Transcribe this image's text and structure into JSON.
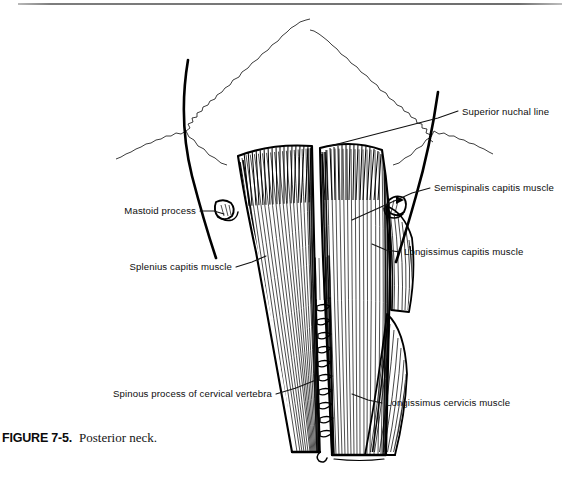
{
  "figure": {
    "caption_label": "FIGURE 7-5.",
    "caption_text": "Posterior neck.",
    "title": "Posterior neck",
    "ink_color": "#000000",
    "paper_color": "#ffffff",
    "annotations": [
      {
        "id": "superior-nuchal-line",
        "label": "Superior nuchal line",
        "align": "left",
        "text_x": 462,
        "text_y": 115,
        "leader": "M 458 111 L 438 118 L 330 146"
      },
      {
        "id": "semispinalis-capitis-muscle",
        "label": "Semispinalis capitis muscle",
        "align": "left",
        "text_x": 434,
        "text_y": 191,
        "leader": "M 430 188 L 412 193 L 352 220"
      },
      {
        "id": "longissimus-capitis-muscle",
        "label": "Longissimus capitis muscle",
        "align": "left",
        "text_x": 404,
        "text_y": 255,
        "leader": "M 400 252 L 386 250 L 372 244"
      },
      {
        "id": "longissimus-cervicis-muscle",
        "label": "Longissimus cervicis muscle",
        "align": "left",
        "text_x": 386,
        "text_y": 406,
        "leader": "M 382 403 L 368 400 L 352 394"
      },
      {
        "id": "mastoid-process",
        "label": "Mastoid process",
        "align": "right",
        "text_x": 196,
        "text_y": 214,
        "leader": "M 200 211 L 214 211 L 224 214"
      },
      {
        "id": "splenius-capitis-muscle",
        "label": "Splenius capitis muscle",
        "align": "right",
        "text_x": 232,
        "text_y": 270,
        "leader": "M 236 267 L 252 262 L 266 256"
      },
      {
        "id": "spinous-process-of-cervical-vertebra",
        "label": "Spinous process of cervical vertebra",
        "align": "right",
        "text_x": 272,
        "text_y": 397,
        "leader": "M 276 394 L 296 388 L 316 380"
      }
    ],
    "structures": [
      {
        "id": "skull-suture",
        "name": "cranial suture (serrated)"
      },
      {
        "id": "semispinalis-capitis",
        "name": "semispinalis capitis muscle belly"
      },
      {
        "id": "splenius-capitis",
        "name": "splenius capitis muscle belly"
      },
      {
        "id": "longissimus-capitis",
        "name": "longissimus capitis muscle"
      },
      {
        "id": "longissimus-cervicis",
        "name": "longissimus cervicis muscle"
      },
      {
        "id": "spinous-process-column",
        "name": "cervical spinous process column"
      },
      {
        "id": "mastoid-process-left",
        "name": "left mastoid process"
      },
      {
        "id": "mastoid-process-right",
        "name": "right mastoid process"
      }
    ]
  }
}
